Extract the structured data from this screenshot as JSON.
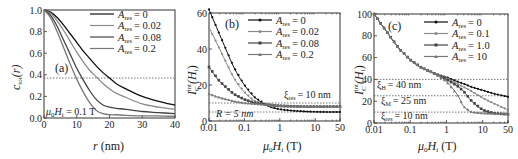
{
  "chart_data": [
    {
      "panel": "(a)",
      "type": "line",
      "title": "",
      "xlabel": "r (nm)",
      "ylabel": "c_tot(r)",
      "xlim": [
        0,
        40
      ],
      "ylim": [
        0,
        1.0
      ],
      "xticks": [
        0,
        10,
        20,
        30,
        40
      ],
      "yticks": [
        0.0,
        0.2,
        0.4,
        0.6,
        0.8,
        1.0
      ],
      "xtick_labels": [
        "0",
        "10",
        "20",
        "30",
        "40"
      ],
      "ytick_labels": [
        "0.0",
        "0.2",
        "0.4",
        "0.6",
        "0.8",
        "1.0"
      ],
      "hline": 0.37,
      "annotation": "μ0Hi = 0.1 T",
      "legend_position": "upper right",
      "x": [
        0,
        2,
        4,
        6,
        8,
        10,
        12,
        14,
        16,
        18,
        20,
        22,
        25,
        30,
        35,
        40
      ],
      "series": [
        {
          "name": "A_res = 0",
          "color": "#111111",
          "values": [
            1.0,
            0.98,
            0.93,
            0.86,
            0.78,
            0.7,
            0.62,
            0.55,
            0.48,
            0.42,
            0.37,
            0.32,
            0.27,
            0.2,
            0.155,
            0.12
          ]
        },
        {
          "name": "A_res = 0.02",
          "color": "#8a8a8a",
          "values": [
            1.0,
            0.97,
            0.9,
            0.81,
            0.71,
            0.61,
            0.52,
            0.44,
            0.38,
            0.32,
            0.27,
            0.23,
            0.19,
            0.13,
            0.1,
            0.08
          ]
        },
        {
          "name": "A_res = 0.08",
          "color": "#444444",
          "values": [
            1.0,
            0.95,
            0.85,
            0.72,
            0.59,
            0.46,
            0.35,
            0.25,
            0.17,
            0.12,
            0.1,
            0.09,
            0.08,
            0.06,
            0.05,
            0.04
          ]
        },
        {
          "name": "A_res = 0.2",
          "color": "#777777",
          "values": [
            1.0,
            0.93,
            0.8,
            0.65,
            0.5,
            0.36,
            0.24,
            0.14,
            0.07,
            0.04,
            0.03,
            0.03,
            0.025,
            0.02,
            0.02,
            0.015
          ]
        }
      ]
    },
    {
      "panel": "(b)",
      "type": "line",
      "title": "",
      "xlabel": "μ0Hi (T)",
      "ylabel": "I_C^int(Hi)",
      "xscale": "log",
      "xlim": [
        0.01,
        50
      ],
      "ylim": [
        0,
        60
      ],
      "xticks": [
        0.01,
        0.1,
        1,
        10,
        50
      ],
      "yticks": [
        0,
        20,
        40,
        60
      ],
      "xtick_labels": [
        "0.01",
        "0.1",
        "1",
        "10",
        "50"
      ],
      "ytick_labels": [
        "0",
        "20",
        "40",
        "60"
      ],
      "hlines": [
        {
          "y": 10,
          "label": "ξ_res = 10 nm"
        },
        {
          "y": 5,
          "label": "R = 5 nm"
        }
      ],
      "legend_position": "upper right",
      "x": [
        0.01,
        0.02,
        0.05,
        0.1,
        0.2,
        0.5,
        1,
        2,
        5,
        10,
        20,
        50
      ],
      "series": [
        {
          "name": "A_res = 0",
          "color": "#111111",
          "marker": "circle",
          "values": [
            62,
            48,
            30,
            20,
            13,
            8,
            6.5,
            5.8,
            5.3,
            5.1,
            5.0,
            5.0
          ]
        },
        {
          "name": "A_res = 0.02",
          "color": "#8a8a8a",
          "marker": "circle",
          "values": [
            52,
            40,
            24,
            16,
            11,
            8.5,
            8.0,
            8.0,
            8.0,
            8.0,
            8.0,
            8.0
          ]
        },
        {
          "name": "A_res = 0.08",
          "color": "#444444",
          "marker": "square",
          "values": [
            30,
            22,
            15,
            12,
            10,
            9,
            8.5,
            8.2,
            8.0,
            8.0,
            8.0,
            8.0
          ]
        },
        {
          "name": "A_res = 0.2",
          "color": "#777777",
          "marker": "triangle",
          "values": [
            15,
            13,
            11,
            10,
            9.5,
            9,
            8.5,
            8.2,
            8.0,
            8.0,
            8.0,
            8.0
          ]
        }
      ]
    },
    {
      "panel": "(c)",
      "type": "line",
      "title": "",
      "xlabel": "μ0Hi (T)",
      "ylabel": "I_C^int(Hi)",
      "xscale": "log",
      "xlim": [
        0.01,
        50
      ],
      "ylim": [
        0,
        100
      ],
      "xticks": [
        0.01,
        0.1,
        1,
        10,
        50
      ],
      "yticks": [
        0,
        20,
        40,
        60,
        80,
        100
      ],
      "xtick_labels": [
        "0.01",
        "0.1",
        "1",
        "10",
        "50"
      ],
      "ytick_labels": [
        "0",
        "20",
        "40",
        "60",
        "80",
        "100"
      ],
      "hlines": [
        {
          "y": 40,
          "label": "ξ_H = 40 nm"
        },
        {
          "y": 25,
          "label": "ξ_M = 25 nm"
        },
        {
          "y": 10,
          "label": "ξ_res = 10 nm"
        }
      ],
      "legend_position": "upper right",
      "x": [
        0.01,
        0.02,
        0.05,
        0.1,
        0.2,
        0.5,
        1,
        2,
        3,
        5,
        10,
        20,
        50
      ],
      "series": [
        {
          "name": "A_res = 0",
          "color": "#111111",
          "marker": "circle",
          "values": [
            100,
            86,
            68,
            58,
            51,
            45,
            42,
            38,
            36,
            33,
            30,
            27,
            24
          ]
        },
        {
          "name": "A_res = 0.1",
          "color": "#8a8a8a",
          "marker": "circle",
          "values": [
            100,
            86,
            68,
            58,
            51,
            45,
            41,
            36,
            33,
            29,
            23,
            18,
            12
          ]
        },
        {
          "name": "A_res = 1.0",
          "color": "#444444",
          "marker": "square",
          "values": [
            100,
            86,
            68,
            58,
            51,
            45,
            40,
            34,
            29,
            20,
            12,
            9,
            8
          ]
        },
        {
          "name": "A_res = 10",
          "color": "#777777",
          "marker": "triangle",
          "values": [
            100,
            86,
            68,
            58,
            51,
            45,
            38,
            26,
            15,
            10,
            9,
            8.5,
            8
          ]
        }
      ]
    }
  ],
  "panels": {
    "a": {
      "label": "(a)",
      "xlabel_var": "r",
      "xlabel_unit": " (nm)",
      "ylabel": "c",
      "ylabel_sub": "tot",
      "ylabel_arg": "(r)",
      "annotation_pre": "μ",
      "annotation_sub0": "0",
      "annotation_H": "H",
      "annotation_subi": "i",
      "annotation_post": " = 0.1 T",
      "legend": [
        "= 0",
        "= 0.02",
        "= 0.08",
        "= 0.2"
      ]
    },
    "b": {
      "label": "(b)",
      "xlabel": "(T)",
      "legend": [
        "= 0",
        "= 0.02",
        "= 0.08",
        "= 0.2"
      ],
      "note1": "= 10 nm",
      "note2": "R = 5 nm"
    },
    "c": {
      "label": "(c)",
      "xlabel": "(T)",
      "legend": [
        "= 0",
        "= 0.1",
        "= 1.0",
        "= 10"
      ],
      "note1": "= 40 nm",
      "note2": "= 25 nm",
      "note3": "= 10 nm"
    }
  }
}
